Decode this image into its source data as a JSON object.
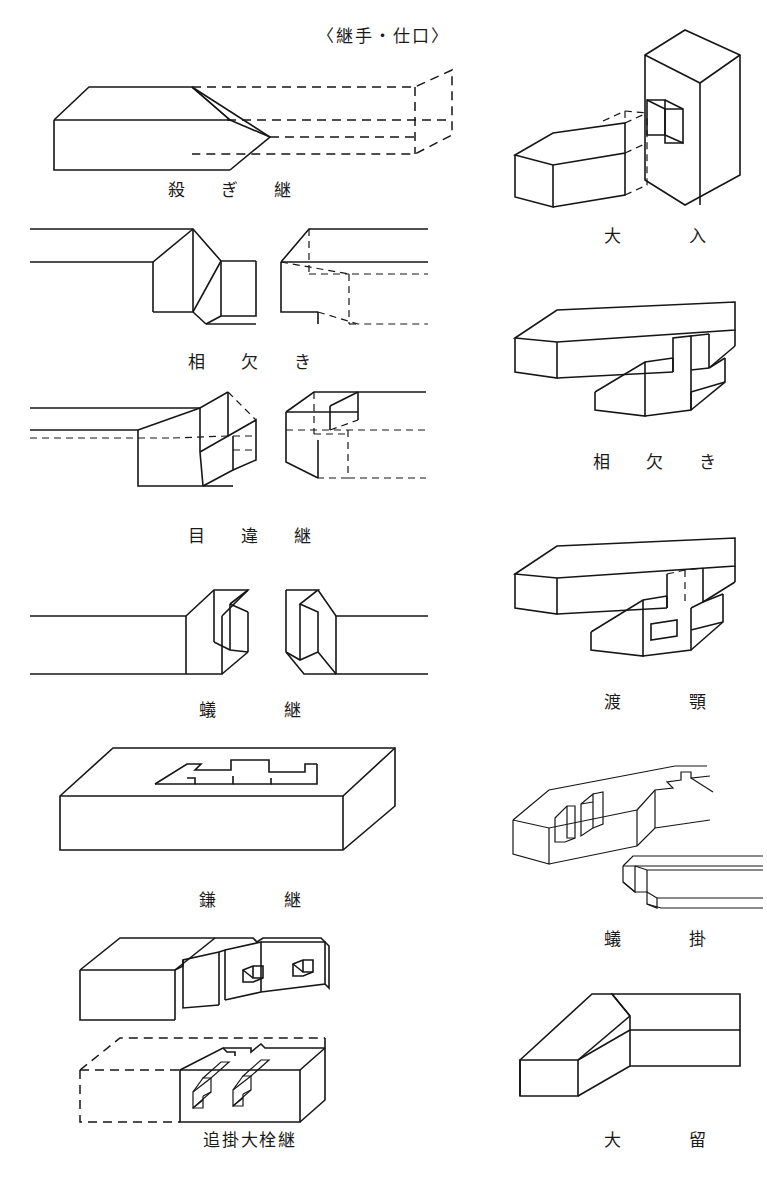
{
  "document": {
    "title": "〈継手・仕口〉",
    "language": "ja",
    "subject": "Japanese carpentry splices (tsugite) and joints (shiguchi) reference plate",
    "drawing_style": "isometric line drawing, black ink on white, hidden edges dashed"
  },
  "figures": {
    "left_column": [
      {
        "id": "sogi-tsugi",
        "caption": "殺 ぎ 継",
        "reading": "sogi-tsugi",
        "english": "scarf splice",
        "description": "Two square timbers spliced on a long diagonal bevel; right-hand member drawn with dashed hidden edges."
      },
      {
        "id": "ai-kaki",
        "caption": "相 欠 き",
        "reading": "ai-kaki",
        "english": "half-lap splice",
        "description": "Pair of half-lapped timber ends, male piece at left and matching female rebate at right with dashed hidden edges."
      },
      {
        "id": "mechigai-tsugi",
        "caption": "目 違 継",
        "reading": "mechigai-tsugi",
        "english": "stub-tenon (slip-tongue) splice",
        "description": "Half-lap with a small square stub tenon and matching mortise; hidden work shown dashed on both members."
      },
      {
        "id": "ari-tsugi",
        "caption": "蟻　継",
        "reading": "ari-tsugi",
        "english": "dovetail splice",
        "description": "Dovetail-shaped tenon on the left member entering a flared socket on the right member."
      },
      {
        "id": "kama-tsugi",
        "caption": "鎌　継",
        "reading": "kama-tsugi",
        "english": "goose-neck (scarf hook) splice",
        "description": "Plan-view of a wide timber showing the goose-neck hooked splice profile cut into its upper face."
      },
      {
        "id": "oikake-daisen-tsugi",
        "caption": "追掛大栓継",
        "reading": "oikake-daisen-tsugi",
        "english": "rabbeted oblique scarf splice with hardwood pegs",
        "description": "Two views: upper member with two square peg holes in the scarf face, lower member with the two pegs shown entering their holes, hidden outline dashed."
      }
    ],
    "right_column": [
      {
        "id": "oire",
        "caption": "大　入",
        "reading": "ō-ire",
        "english": "full housed joint",
        "description": "Horizontal beam entering a rectangular through-mortise cut in a standing post; hidden tenon drawn dashed."
      },
      {
        "id": "ai-kaki-shiguchi",
        "caption": "相 欠 き",
        "reading": "ai-kaki",
        "english": "cross half-lap joint",
        "description": "Two beams crossing at right angles, each half-notched so their faces are flush."
      },
      {
        "id": "watari-ago",
        "caption": "渡　顎",
        "reading": "watari-ago",
        "english": "crossing-jaw joint",
        "description": "Beam passing over a lower member with a shouldered jaw notch; hidden housing drawn dashed."
      },
      {
        "id": "ari-kake",
        "caption": "蟻　掛",
        "reading": "ari-kake",
        "english": "dovetail hanging joint",
        "description": "Upper view shows the dovetail socket cut in the receiving beam, lower view shows the dovetail tongue on the end of the incoming beam."
      },
      {
        "id": "odome",
        "caption": "大　留",
        "reading": "ō-dome",
        "english": "full mitre corner joint",
        "description": "Two timbers meeting at a right-angled corner joined on a 45° mitre."
      }
    ]
  },
  "colors": {
    "ink": "#161616",
    "paper": "#ffffff"
  }
}
